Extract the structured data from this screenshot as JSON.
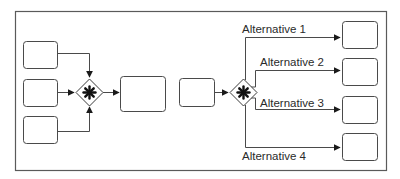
{
  "diagram": {
    "type": "bpmn-gateways",
    "colors": {
      "stroke": "#4a4a4a",
      "frame": "#5a5a5a",
      "text": "#2a2a2a",
      "background": "#ffffff"
    },
    "left_section": {
      "description": "Three inputs merge via inclusive/complex gateway into one task",
      "input_tasks": [
        "",
        "",
        ""
      ],
      "gateway": {
        "icon": "asterisk-icon",
        "kind": "complex-gateway"
      },
      "output_task": ""
    },
    "right_section": {
      "description": "One task splits via complex gateway into four alternatives",
      "input_task": "",
      "gateway": {
        "icon": "asterisk-icon",
        "kind": "complex-gateway"
      },
      "alternatives": [
        {
          "label": "Alternative 1"
        },
        {
          "label": "Alternative 2"
        },
        {
          "label": "Alternative 3"
        },
        {
          "label": "Alternative 4"
        }
      ]
    }
  }
}
